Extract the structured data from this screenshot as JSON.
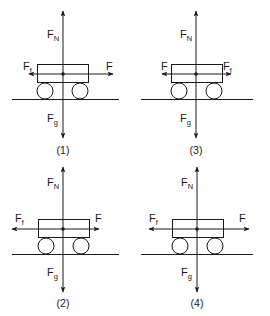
{
  "figure": {
    "diagrams": [
      {
        "id": "1",
        "caption": "(1)",
        "forces": {
          "up": {
            "main": "F",
            "sub": "N"
          },
          "down": {
            "main": "F",
            "sub": "g"
          },
          "left": {
            "main": "F",
            "sub": "f"
          },
          "right": {
            "main": "F",
            "sub": ""
          }
        },
        "arrows": {
          "left_len": "short",
          "right_len": "long"
        }
      },
      {
        "id": "3",
        "caption": "(3)",
        "forces": {
          "up": {
            "main": "F",
            "sub": "N"
          },
          "down": {
            "main": "F",
            "sub": "g"
          },
          "left": {
            "main": "F",
            "sub": ""
          },
          "right": {
            "main": "F",
            "sub": "f"
          }
        },
        "arrows": {
          "left_len": "short",
          "right_len": "short"
        }
      },
      {
        "id": "2",
        "caption": "(2)",
        "forces": {
          "up": {
            "main": "F",
            "sub": "N"
          },
          "down": {
            "main": "F",
            "sub": "g"
          },
          "left": {
            "main": "F",
            "sub": "f"
          },
          "right": {
            "main": "F",
            "sub": ""
          }
        },
        "arrows": {
          "left_len": "long",
          "right_len": "short"
        }
      },
      {
        "id": "4",
        "caption": "(4)",
        "forces": {
          "up": {
            "main": "F",
            "sub": "N"
          },
          "down": {
            "main": "F",
            "sub": "g"
          },
          "left": {
            "main": "F",
            "sub": "f"
          },
          "right": {
            "main": "F",
            "sub": ""
          }
        },
        "arrows": {
          "left_len": "long",
          "right_len": "long"
        }
      }
    ],
    "colors": {
      "ink": "#1a1a1a",
      "background": "#ffffff"
    }
  }
}
